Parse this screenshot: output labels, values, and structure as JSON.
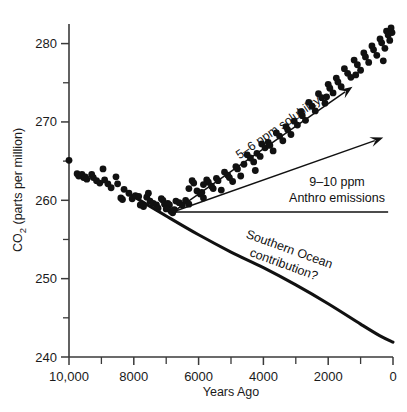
{
  "chart_data": {
    "type": "scatter",
    "title": "",
    "subtitle": "",
    "xlabel": "Years Ago",
    "ylabel": "CO2 (parts per million)",
    "ylabel_parts": {
      "prefix": "CO",
      "subscript": "2",
      "suffix": " (parts per million)"
    },
    "xlim": [
      10000,
      0
    ],
    "ylim": [
      240,
      282.5
    ],
    "x_axis_reversed": true,
    "grid": false,
    "legend": null,
    "x_tick_labels": [
      "10,000",
      "8000",
      "6000",
      "4000",
      "2000",
      "0"
    ],
    "x_tick_values": [
      10000,
      8000,
      6000,
      4000,
      2000,
      0
    ],
    "x_minor_tick_values": [
      9000,
      7000,
      5000,
      3000,
      1000
    ],
    "y_tick_labels": [
      "280",
      "270",
      "260",
      "250",
      "240"
    ],
    "y_tick_values": [
      280,
      270,
      260,
      250,
      240
    ],
    "y_minor_tick_values": [
      275,
      265,
      255,
      245
    ],
    "series": [
      {
        "name": "Ice core CO2 measurements",
        "type": "scatter",
        "marker": "filled-circle",
        "color": "#111111",
        "points": [
          [
            10000,
            265.1
          ],
          [
            9750,
            263.4
          ],
          [
            9700,
            263.1
          ],
          [
            9600,
            263.3
          ],
          [
            9550,
            262.9
          ],
          [
            9500,
            263.0
          ],
          [
            9450,
            262.7
          ],
          [
            9300,
            263.3
          ],
          [
            9250,
            262.9
          ],
          [
            9150,
            262.5
          ],
          [
            9050,
            262.2
          ],
          [
            8950,
            264.0
          ],
          [
            8900,
            262.6
          ],
          [
            8800,
            262.1
          ],
          [
            8700,
            261.6
          ],
          [
            8550,
            263.0
          ],
          [
            8500,
            262.1
          ],
          [
            8400,
            260.3
          ],
          [
            8350,
            260.1
          ],
          [
            8300,
            261.4
          ],
          [
            8150,
            260.9
          ],
          [
            8050,
            260.2
          ],
          [
            7950,
            260.6
          ],
          [
            7850,
            260.5
          ],
          [
            7800,
            259.4
          ],
          [
            7700,
            259.2
          ],
          [
            7600,
            260.4
          ],
          [
            7550,
            260.9
          ],
          [
            7500,
            259.9
          ],
          [
            7400,
            259.6
          ],
          [
            7300,
            259.4
          ],
          [
            7250,
            259.0
          ],
          [
            7150,
            260.2
          ],
          [
            7100,
            260.0
          ],
          [
            7050,
            259.5
          ],
          [
            6950,
            259.6
          ],
          [
            6900,
            259.4
          ],
          [
            6850,
            258.6
          ],
          [
            6800,
            258.4
          ],
          [
            6700,
            259.9
          ],
          [
            6600,
            259.7
          ],
          [
            6500,
            259.4
          ],
          [
            6400,
            260.0
          ],
          [
            6300,
            259.5
          ],
          [
            6200,
            262.5
          ],
          [
            6150,
            262.2
          ],
          [
            6050,
            261.2
          ],
          [
            5950,
            260.8
          ],
          [
            5900,
            261.0
          ],
          [
            5850,
            260.3
          ],
          [
            5750,
            262.6
          ],
          [
            5700,
            262.3
          ],
          [
            5600,
            261.8
          ],
          [
            5550,
            261.5
          ],
          [
            5450,
            262.8
          ],
          [
            5400,
            262.5
          ],
          [
            5300,
            261.3
          ],
          [
            5200,
            263.6
          ],
          [
            5100,
            263.2
          ],
          [
            5050,
            262.9
          ],
          [
            4950,
            262.4
          ],
          [
            4850,
            264.3
          ],
          [
            4800,
            264.0
          ],
          [
            4700,
            263.1
          ],
          [
            4600,
            264.6
          ],
          [
            4500,
            265.8
          ],
          [
            4400,
            265.4
          ],
          [
            4300,
            264.9
          ],
          [
            4200,
            266.0
          ],
          [
            4100,
            265.6
          ],
          [
            4050,
            267.2
          ],
          [
            3950,
            266.7
          ],
          [
            3850,
            267.4
          ],
          [
            3800,
            267.0
          ],
          [
            3700,
            266.3
          ],
          [
            3600,
            268.6
          ],
          [
            3500,
            268.2
          ],
          [
            3400,
            267.6
          ],
          [
            3300,
            269.4
          ],
          [
            3250,
            269.0
          ],
          [
            3150,
            268.4
          ],
          [
            3050,
            270.1
          ],
          [
            2950,
            269.6
          ],
          [
            2850,
            271.3
          ],
          [
            2800,
            270.8
          ],
          [
            2700,
            270.2
          ],
          [
            2600,
            272.5
          ],
          [
            2500,
            272.0
          ],
          [
            2400,
            271.4
          ],
          [
            2300,
            273.6
          ],
          [
            2200,
            273.1
          ],
          [
            2100,
            272.4
          ],
          [
            2000,
            274.8
          ],
          [
            1950,
            274.3
          ],
          [
            1850,
            273.7
          ],
          [
            1750,
            275.6
          ],
          [
            1700,
            275.1
          ],
          [
            1600,
            274.5
          ],
          [
            1500,
            276.8
          ],
          [
            1400,
            276.2
          ],
          [
            1300,
            275.7
          ],
          [
            1200,
            277.9
          ],
          [
            1100,
            277.3
          ],
          [
            1000,
            276.6
          ],
          [
            900,
            278.8
          ],
          [
            850,
            278.3
          ],
          [
            750,
            277.6
          ],
          [
            650,
            279.7
          ],
          [
            600,
            279.2
          ],
          [
            500,
            278.5
          ],
          [
            400,
            280.6
          ],
          [
            350,
            280.1
          ],
          [
            250,
            279.4
          ],
          [
            200,
            281.6
          ],
          [
            150,
            281.1
          ],
          [
            100,
            280.4
          ],
          [
            60,
            282.0
          ],
          [
            30,
            281.4
          ],
          [
            6300,
            261.5
          ],
          [
            5850,
            262.0
          ],
          [
            7000,
            258.9
          ],
          [
            6750,
            258.8
          ],
          [
            4250,
            263.8
          ],
          [
            2050,
            273.2
          ],
          [
            1150,
            276.0
          ],
          [
            300,
            277.8
          ]
        ]
      }
    ],
    "curves": [
      {
        "name": "Southern Ocean contribution curve",
        "type": "line",
        "color": "#111111",
        "points": [
          [
            8050,
            260.6
          ],
          [
            7000,
            258.0
          ],
          [
            6000,
            255.6
          ],
          [
            5000,
            253.4
          ],
          [
            4000,
            251.4
          ],
          [
            3000,
            249.2
          ],
          [
            2000,
            246.8
          ],
          [
            1000,
            244.2
          ],
          [
            400,
            242.7
          ],
          [
            0,
            241.9
          ]
        ]
      }
    ],
    "annotations": [
      {
        "name": "solubility-arrow",
        "label": "5–6 ppm solubility",
        "from": [
          6800,
          258.5
        ],
        "to": [
          1250,
          274.5
        ],
        "rotated": true,
        "label_position": "along-arrow"
      },
      {
        "name": "anthro-emissions-arrow",
        "label_line1": "9–10 ppm",
        "label_line2": "Anthro emissions",
        "from": [
          6800,
          258.5
        ],
        "to": [
          300,
          268.0
        ],
        "rotated": false,
        "label_position": "below-arrow"
      },
      {
        "name": "baseline-arrow",
        "label": "",
        "from": [
          6800,
          258.5
        ],
        "to": [
          150,
          258.5
        ],
        "rotated": false,
        "label_position": "none"
      },
      {
        "name": "southern-ocean-label",
        "label_line1": "Southern Ocean",
        "label_line2": "contribution?",
        "rotated": true,
        "label_position": "below-curve"
      }
    ]
  },
  "colors": {
    "axis": "#3a3a3a",
    "data": "#111111",
    "background": "#ffffff",
    "text": "#1a1a1a"
  }
}
